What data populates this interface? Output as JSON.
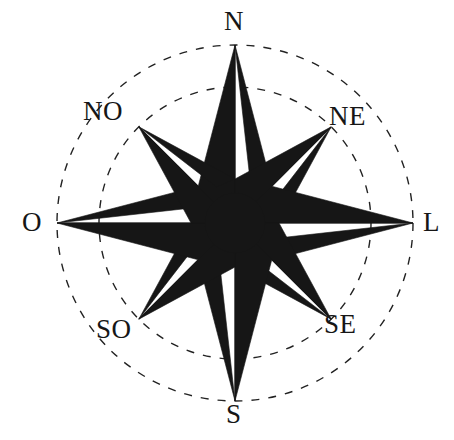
{
  "figure": {
    "name": "compass-rose",
    "type": "compass-rose-diagram",
    "background_color": "#ffffff",
    "ink_color": "#161616",
    "language": "fr"
  },
  "geometry": {
    "center_x": 235,
    "center_y": 223,
    "outer_circle_radius": 178,
    "inner_circle_radius": 136,
    "cardinal_ray_length": 178,
    "intercardinal_ray_length": 136,
    "ray_count": 8,
    "circle_style": "dashed",
    "circle_dash_pattern": "8 9",
    "circle_stroke_width": 1.4
  },
  "points": [
    {
      "id": "n",
      "label": "N",
      "angle_deg": 0,
      "kind": "cardinal",
      "reaches": "outer"
    },
    {
      "id": "ne",
      "label": "NE",
      "angle_deg": 45,
      "kind": "intercardinal",
      "reaches": "inner"
    },
    {
      "id": "l",
      "label": "L",
      "angle_deg": 90,
      "kind": "cardinal",
      "reaches": "outer"
    },
    {
      "id": "se",
      "label": "SE",
      "angle_deg": 135,
      "kind": "intercardinal",
      "reaches": "inner"
    },
    {
      "id": "s",
      "label": "S",
      "angle_deg": 180,
      "kind": "cardinal",
      "reaches": "outer"
    },
    {
      "id": "so",
      "label": "SO",
      "angle_deg": 225,
      "kind": "intercardinal",
      "reaches": "inner"
    },
    {
      "id": "o",
      "label": "O",
      "angle_deg": 270,
      "kind": "cardinal",
      "reaches": "outer"
    },
    {
      "id": "no",
      "label": "NO",
      "angle_deg": 315,
      "kind": "intercardinal",
      "reaches": "inner"
    }
  ],
  "labels": {
    "north": "N",
    "northeast": "NE",
    "east": "L",
    "southeast": "SE",
    "south": "S",
    "southwest": "SO",
    "west": "O",
    "northwest": "NO"
  }
}
